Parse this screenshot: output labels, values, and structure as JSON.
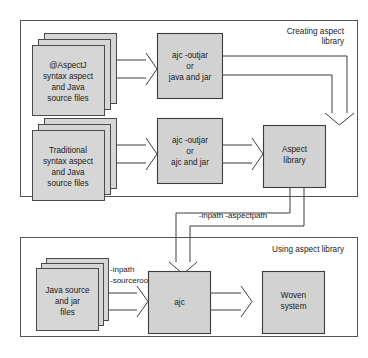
{
  "diagram": {
    "colors": {
      "node_fill": "#d2d2d2",
      "node_stroke": "#3d3d3d",
      "container_stroke": "#555555",
      "background": "#ffffff",
      "text": "#1a1a1a"
    },
    "containers": [
      {
        "id": "creating",
        "title_line1": "Creating aspect",
        "title_line2": "library"
      },
      {
        "id": "using",
        "title_line1": "Using aspect library",
        "title_line2": ""
      }
    ],
    "nodes": [
      {
        "id": "atAspectJ-sources",
        "type": "stack",
        "lines": [
          "@AspectJ",
          "syntax aspect",
          "and Java",
          "source files"
        ]
      },
      {
        "id": "traditional-sources",
        "type": "stack",
        "lines": [
          "Traditional",
          "syntax aspect",
          "and Java",
          "source files"
        ]
      },
      {
        "id": "ajc-outjar-java",
        "type": "process",
        "lines": [
          "ajc -outjar",
          "or",
          "java and jar"
        ]
      },
      {
        "id": "ajc-outjar-ajc",
        "type": "process",
        "lines": [
          "ajc -outjar",
          "or",
          "ajc and jar"
        ]
      },
      {
        "id": "aspect-library",
        "type": "artifact",
        "lines": [
          "Aspect",
          "library"
        ]
      },
      {
        "id": "java-sources",
        "type": "stack",
        "lines": [
          "Java source",
          "and jar",
          "files"
        ]
      },
      {
        "id": "ajc",
        "type": "process",
        "lines": [
          "ajc"
        ]
      },
      {
        "id": "woven-system",
        "type": "artifact",
        "lines": [
          "Woven",
          "system"
        ]
      }
    ],
    "edge_labels": [
      {
        "id": "inpath-aspectpath",
        "text": "-inpath -aspectpath"
      },
      {
        "id": "inpath-sourceroot",
        "line1": "-inpath",
        "line2": "-sourceroot"
      }
    ]
  }
}
